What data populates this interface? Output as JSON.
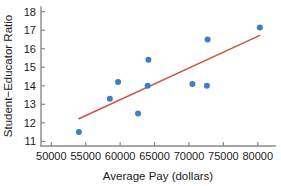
{
  "chart_data": {
    "type": "scatter",
    "title": "",
    "subtitle": "",
    "xlabel": "Average Pay (dollars)",
    "ylabel": "Student−Educator Ratio",
    "xlim": [
      48500,
      82500
    ],
    "ylim": [
      10.75,
      18.25
    ],
    "xticks": [
      50000,
      55000,
      60000,
      65000,
      70000,
      75000,
      80000
    ],
    "xtick_labels": [
      "50000",
      "55000",
      "60000",
      "65000",
      "70000",
      "75000",
      "80000"
    ],
    "yticks": [
      11,
      12,
      13,
      14,
      15,
      16,
      17,
      18
    ],
    "ytick_labels": [
      "11",
      "12",
      "13",
      "14",
      "15",
      "16",
      "17",
      "18"
    ],
    "grid": false,
    "legend": null,
    "point_color": "#3c7fc4",
    "point_size": 3.0,
    "line_color": "#c9543f",
    "axis_color": "#8a8a8a",
    "points": [
      {
        "x": 54000,
        "y": 11.5
      },
      {
        "x": 58500,
        "y": 13.3
      },
      {
        "x": 59700,
        "y": 14.2
      },
      {
        "x": 62600,
        "y": 12.5
      },
      {
        "x": 64000,
        "y": 14.0
      },
      {
        "x": 64100,
        "y": 15.4
      },
      {
        "x": 70500,
        "y": 14.1
      },
      {
        "x": 72600,
        "y": 14.0
      },
      {
        "x": 72700,
        "y": 16.5
      },
      {
        "x": 80300,
        "y": 17.15
      }
    ],
    "trend_line": {
      "label": "least-squares regression line",
      "x_start": 54000,
      "y_start": 12.22,
      "x_end": 80300,
      "y_end": 16.72
    },
    "annotations": []
  }
}
